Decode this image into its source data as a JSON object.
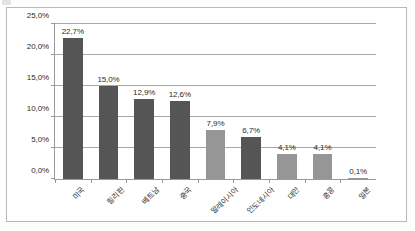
{
  "chart_data": {
    "type": "bar",
    "title": "",
    "subtitle": "",
    "xlabel": "",
    "ylabel": "",
    "ylim": [
      0,
      25
    ],
    "grid": true,
    "legend": "none",
    "decimal_separator": ",",
    "value_suffix": "%",
    "categories": [
      "미국",
      "필리핀",
      "베트남",
      "중국",
      "말레이시아",
      "인도네시아",
      "대만",
      "홍콩",
      "일본"
    ],
    "values": [
      22.7,
      15.0,
      12.9,
      12.6,
      7.9,
      6.7,
      4.1,
      4.1,
      0.1
    ],
    "value_labels": [
      "22,7%",
      "15,0%",
      "12,9%",
      "12,6%",
      "7,9%",
      "6,7%",
      "4,1%",
      "4,1%",
      "0,1%"
    ],
    "bar_shades": [
      "dark",
      "dark",
      "dark",
      "dark",
      "light",
      "dark",
      "light",
      "light",
      "light"
    ],
    "yticks": [
      0,
      5,
      10,
      15,
      20,
      25
    ],
    "ytick_labels": [
      "0,0%",
      "5,0%",
      "10,0%",
      "15,0%",
      "20,0%",
      "25,0%"
    ],
    "colors": {
      "bar_dark": "#555555",
      "bar_light": "#969696",
      "gridline": "#a8a8a8",
      "axis": "#9a9a9a",
      "text": "#2b2b2b",
      "frame": "#b9b9b9",
      "background": "#ffffff"
    }
  }
}
